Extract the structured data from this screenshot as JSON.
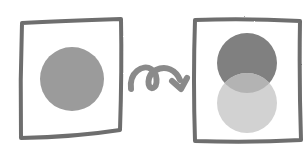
{
  "diagram": {
    "description": "Hand-drawn sketch: a frame with one circle, a looping arrow, then a frame where the circle becomes two overlapping circles",
    "before_frame": {
      "label": "before",
      "circle": {
        "color": "#9b9b9b"
      }
    },
    "arrow": {
      "label": "transform",
      "color": "#8a8a8a"
    },
    "after_frame": {
      "label": "after",
      "top_circle": {
        "color": "#808080"
      },
      "bottom_circle": {
        "color": "#d2d2d2"
      },
      "overlap_color": "#b3b3b3"
    },
    "stroke_color": "#6e6e6e"
  }
}
